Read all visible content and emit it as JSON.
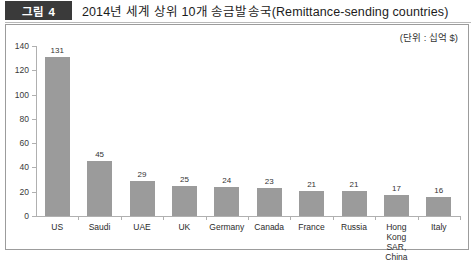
{
  "header": {
    "figure_tag": "그림 4",
    "title": "2014년 세계 상위 10개 송금발송국(Remittance-sending countries)"
  },
  "chart": {
    "unit_label": "(단위 : 십억 $)"
  },
  "chart_data": {
    "type": "bar",
    "title": "2014년 세계 상위 10개 송금발송국(Remittance-sending countries)",
    "xlabel": "",
    "ylabel": "",
    "unit": "(단위 : 십억 $)",
    "categories": [
      "US",
      "Saudi",
      "UAE",
      "UK",
      "Germany",
      "Canada",
      "France",
      "Russia",
      "Hong Kong\nSAR, China",
      "Italy"
    ],
    "values": [
      131,
      45,
      29,
      25,
      24,
      23,
      21,
      21,
      17,
      16
    ],
    "ylim": [
      0,
      140
    ],
    "yticks": [
      0,
      20,
      40,
      60,
      80,
      100,
      120,
      140
    ],
    "grid": false,
    "legend": false,
    "bar_color": "#9b9b9b"
  }
}
